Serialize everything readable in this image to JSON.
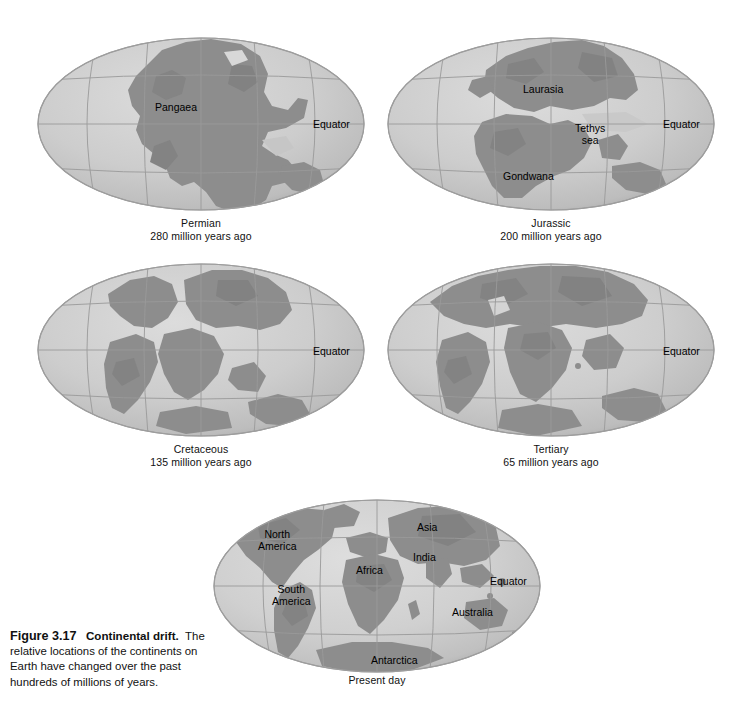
{
  "figure": {
    "number": "Figure 3.17",
    "title": "Continental drift.",
    "body": "The relative locations of the continents on Earth have changed over the past hundreds of millions of years.",
    "equator_label": "Equator"
  },
  "colors": {
    "ocean": "#c9c9c9",
    "ocean_light": "#d6d6d6",
    "land": "#8d8d8d",
    "land_dark": "#7b7b7b",
    "graticule": "#9a9a9a",
    "rim": "#9d9d9d",
    "background": "#ffffff",
    "text": "#111111"
  },
  "panels": [
    {
      "id": "permian",
      "epoch": "Permian",
      "age": "280 million years ago",
      "equator_label": "Equator",
      "labels": [
        {
          "name": "pangaea",
          "text": "Pangaea",
          "x": 155,
          "y": 101
        },
        {
          "name": "equator",
          "text": "Equator",
          "x": 313,
          "y": 118
        }
      ]
    },
    {
      "id": "jurassic",
      "epoch": "Jurassic",
      "age": "200 million years ago",
      "equator_label": "Equator",
      "labels": [
        {
          "name": "laurasia",
          "text": "Laurasia",
          "x": 523,
          "y": 83
        },
        {
          "name": "tethys-sea",
          "text": "Tethys\nsea",
          "x": 575,
          "y": 122
        },
        {
          "name": "gondwana",
          "text": "Gondwana",
          "x": 503,
          "y": 170
        },
        {
          "name": "equator",
          "text": "Equator",
          "x": 663,
          "y": 118
        }
      ]
    },
    {
      "id": "cretaceous",
      "epoch": "Cretaceous",
      "age": "135 million years ago",
      "equator_label": "Equator",
      "labels": [
        {
          "name": "equator",
          "text": "Equator",
          "x": 313,
          "y": 345
        }
      ]
    },
    {
      "id": "tertiary",
      "epoch": "Tertiary",
      "age": "65 million years ago",
      "equator_label": "Equator",
      "labels": [
        {
          "name": "equator",
          "text": "Equator",
          "x": 663,
          "y": 345
        }
      ]
    },
    {
      "id": "present-day",
      "epoch": "Present day",
      "age": "",
      "equator_label": "Equator",
      "labels": [
        {
          "name": "north-america",
          "text": "North\nAmerica",
          "x": 258,
          "y": 528
        },
        {
          "name": "asia",
          "text": "Asia",
          "x": 417,
          "y": 521
        },
        {
          "name": "india",
          "text": "India",
          "x": 413,
          "y": 551
        },
        {
          "name": "africa",
          "text": "Africa",
          "x": 356,
          "y": 564
        },
        {
          "name": "south-america",
          "text": "South\nAmerica",
          "x": 272,
          "y": 583
        },
        {
          "name": "australia",
          "text": "Australia",
          "x": 452,
          "y": 606
        },
        {
          "name": "antarctica",
          "text": "Antarctica",
          "x": 371,
          "y": 654
        },
        {
          "name": "equator",
          "text": "Equator",
          "x": 490,
          "y": 575
        }
      ]
    }
  ],
  "layout": {
    "globe_width": 330,
    "globe_height": 182,
    "row1_top": 36,
    "row2_top": 262,
    "row3_top": 498,
    "col1_left": 36,
    "col2_left": 386,
    "col3_left": 212
  }
}
